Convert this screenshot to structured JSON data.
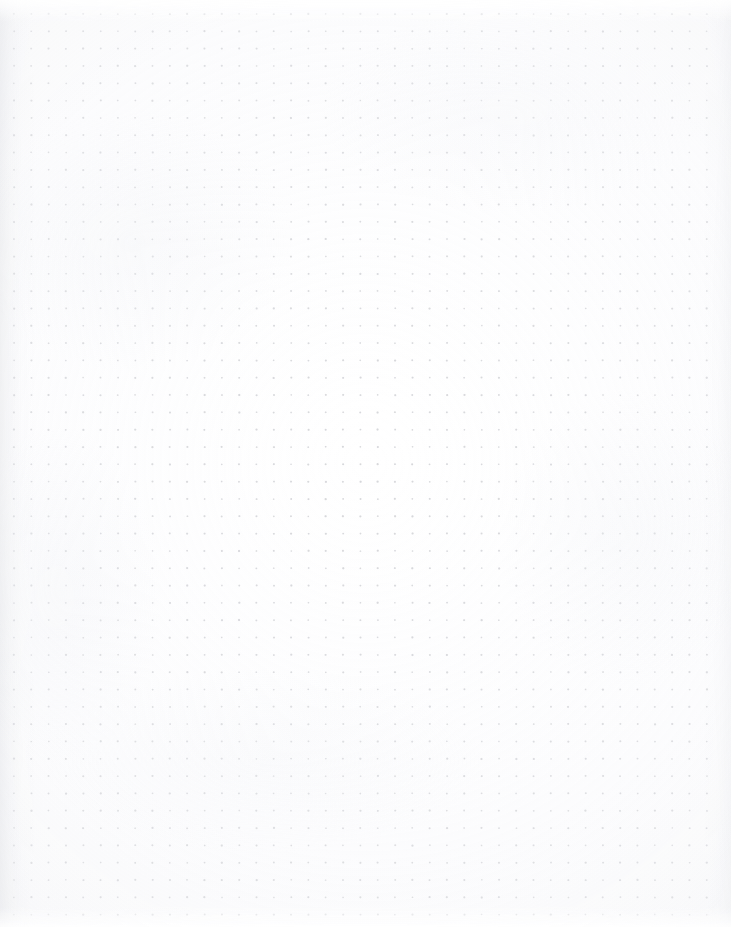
{
  "page": {
    "kind": "dot-grid-notebook-page",
    "width_px": 731,
    "height_px": 927,
    "orientation": "portrait",
    "content_text": "",
    "annotations": [],
    "handwriting": []
  },
  "paper": {
    "background_color": "#fdfdfd",
    "highlight_color": "#ffffff",
    "edge_shadow_color": "#ced0d6",
    "vignette_color": "#f2f3f6",
    "texture": "scanned-paper",
    "has_visible_ruling_lines": false,
    "has_margin_rule": false,
    "has_holes": false,
    "has_header": false,
    "has_footer": false
  },
  "grid": {
    "style": "dot",
    "dot_color": "#c9cace",
    "dot_color_soft": "#d6d7db",
    "dot_radius_px": 0.95,
    "spacing_px": 17.32,
    "origin_x_px": 14,
    "origin_y_px": 14,
    "columns": 41,
    "rows": 53,
    "left_margin_px": 14,
    "right_margin_px": 24,
    "top_margin_px": 14,
    "bottom_margin_px": 15
  }
}
